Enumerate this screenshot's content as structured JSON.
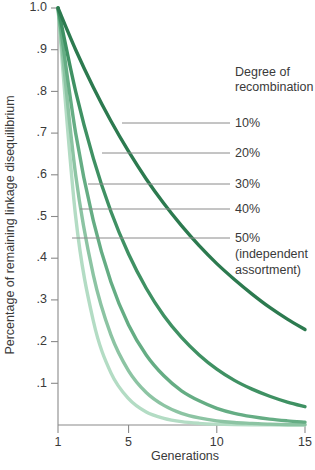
{
  "chart_data": {
    "type": "line",
    "title": "",
    "xlabel": "Generations",
    "ylabel": "Percentage of remaining linkage disequilibrium",
    "xlim": [
      1,
      15
    ],
    "ylim": [
      0,
      1.0
    ],
    "grid": false,
    "legend_position": "right",
    "legend_title_line1": "Degree of",
    "legend_title_line2": "recombination",
    "xticks": [
      {
        "value": 1,
        "label": "1"
      },
      {
        "value": 5,
        "label": "5"
      },
      {
        "value": 10,
        "label": "10"
      },
      {
        "value": 15,
        "label": "15"
      }
    ],
    "yticks": [
      {
        "value": 1.0,
        "label": "1.0"
      },
      {
        "value": 0.9,
        "label": ".9"
      },
      {
        "value": 0.8,
        "label": ".8"
      },
      {
        "value": 0.7,
        "label": ".7"
      },
      {
        "value": 0.6,
        "label": ".6"
      },
      {
        "value": 0.5,
        "label": ".5"
      },
      {
        "value": 0.4,
        "label": ".4"
      },
      {
        "value": 0.3,
        "label": ".3"
      },
      {
        "value": 0.2,
        "label": ".2"
      },
      {
        "value": 0.1,
        "label": ".1"
      }
    ],
    "x": [
      1,
      2,
      3,
      4,
      5,
      6,
      7,
      8,
      9,
      10,
      11,
      12,
      13,
      14,
      15
    ],
    "series": [
      {
        "name": "10%",
        "recombination_fraction": 0.1,
        "color": "#2c7a4f",
        "values": [
          1.0,
          0.9,
          0.81,
          0.729,
          0.656,
          0.59,
          0.531,
          0.478,
          0.43,
          0.387,
          0.349,
          0.314,
          0.282,
          0.254,
          0.229
        ],
        "label": "10%"
      },
      {
        "name": "20%",
        "recombination_fraction": 0.2,
        "color": "#3f9163",
        "values": [
          1.0,
          0.8,
          0.64,
          0.512,
          0.41,
          0.328,
          0.262,
          0.21,
          0.168,
          0.134,
          0.107,
          0.086,
          0.069,
          0.055,
          0.044
        ],
        "label": "20%"
      },
      {
        "name": "30%",
        "recombination_fraction": 0.3,
        "color": "#65ad84",
        "values": [
          1.0,
          0.7,
          0.49,
          0.343,
          0.24,
          0.168,
          0.118,
          0.082,
          0.058,
          0.04,
          0.028,
          0.02,
          0.014,
          0.01,
          0.007
        ],
        "label": "30%"
      },
      {
        "name": "40%",
        "recombination_fraction": 0.4,
        "color": "#8cc4a3",
        "values": [
          1.0,
          0.6,
          0.36,
          0.216,
          0.13,
          0.078,
          0.047,
          0.028,
          0.017,
          0.01,
          0.006,
          0.004,
          0.002,
          0.001,
          0.001
        ],
        "label": "40%"
      },
      {
        "name": "50%",
        "recombination_fraction": 0.5,
        "color": "#b3dcc4",
        "values": [
          1.0,
          0.5,
          0.25,
          0.125,
          0.063,
          0.031,
          0.016,
          0.008,
          0.004,
          0.002,
          0.001,
          0.0005,
          0.0002,
          0.0001,
          0.0001
        ],
        "label": "50%"
      }
    ],
    "legend_entries": [
      {
        "label": "10%",
        "sublabel": "",
        "sublabel2": ""
      },
      {
        "label": "20%",
        "sublabel": "",
        "sublabel2": ""
      },
      {
        "label": "30%",
        "sublabel": "",
        "sublabel2": ""
      },
      {
        "label": "40%",
        "sublabel": "",
        "sublabel2": ""
      },
      {
        "label": "50%",
        "sublabel": "(independent",
        "sublabel2": "assortment)"
      }
    ],
    "colors": {
      "axis": "#8a8a8a",
      "text": "#3a3a3a",
      "leader": "#8a8a8a",
      "background": "#ffffff"
    }
  }
}
